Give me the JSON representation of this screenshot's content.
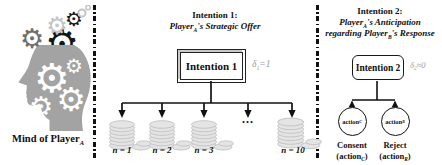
{
  "colors": {
    "text": "#111111",
    "delta_gray": "#9a9a9a",
    "head_gray": "#a3a3a3",
    "gear_dark": "#6f6f6f",
    "gear_light": "#c4c4c4",
    "gear_black": "#161616",
    "coin_fill": "#e4e4e4",
    "coin_stroke": "#c2c2c2",
    "line": "#111111"
  },
  "icons": {
    "gear_glyph": "⚙"
  },
  "panels": {
    "left": {
      "label": {
        "pre": "Mind of Player",
        "sub": "A"
      }
    },
    "mid": {
      "header_line1": "Intention 1:",
      "header_line2": {
        "pre": "Player",
        "sub": "A",
        "post": "'s Strategic Offer"
      },
      "box_label": "Intention 1",
      "delta": {
        "pre": "δ",
        "sub": "1",
        "post": "=1"
      },
      "ellipsis": "...",
      "offers": [
        {
          "label": "n = 1"
        },
        {
          "label": "n = 2"
        },
        {
          "label": "n = 3"
        },
        {
          "label": "n = 10"
        }
      ]
    },
    "right": {
      "header_line1": "Intention 2:",
      "header_line2": {
        "pre": "Player",
        "sub": "A",
        "post": "'s Anticipation"
      },
      "header_line3": {
        "pre": "regarding Player",
        "sub": "B",
        "post": "'s Response"
      },
      "box_label": "Intention 2",
      "delta": {
        "pre": "δ",
        "sub": "2",
        "post": "≈0"
      },
      "actions": [
        {
          "circle_pre": "action",
          "circle_sub": "C",
          "label1": "Consent",
          "label2_pre": "(action",
          "label2_sub": "C",
          "label2_post": ")"
        },
        {
          "circle_pre": "action",
          "circle_sub": "R",
          "label1": "Reject",
          "label2_pre": "(action",
          "label2_sub": "R",
          "label2_post": ")"
        }
      ]
    }
  }
}
